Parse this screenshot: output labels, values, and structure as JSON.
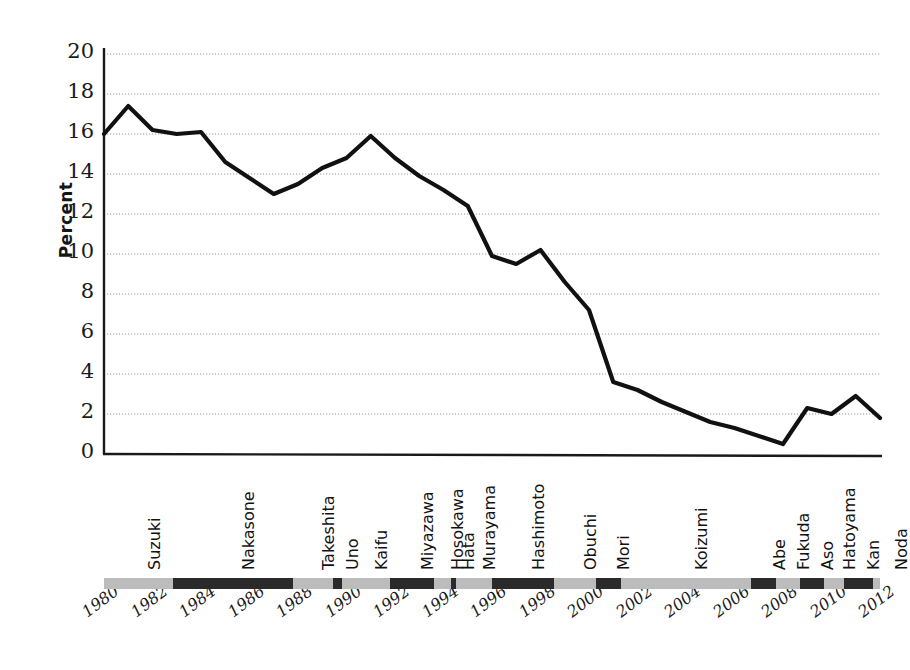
{
  "chart_data": {
    "type": "line",
    "title": "",
    "xlabel": "",
    "ylabel": "Percent",
    "ylim": [
      0,
      20
    ],
    "ytick_step": 2,
    "yticks": [
      20,
      18,
      16,
      14,
      12,
      10,
      8,
      6,
      4,
      2,
      0
    ],
    "xlim": [
      1980,
      2012
    ],
    "xticks": [
      "1980",
      "1982",
      "1984",
      "1986",
      "1988",
      "1990",
      "1992",
      "1994",
      "1996",
      "1998",
      "2000",
      "2002",
      "2004",
      "2006",
      "2008",
      "2010",
      "2012"
    ],
    "grid": "horizontal",
    "legend": "none",
    "series": [
      {
        "name": "Percent",
        "color": "#111111",
        "x": [
          1980,
          1981,
          1982,
          1983,
          1984,
          1985,
          1986,
          1987,
          1988,
          1989,
          1990,
          1991,
          1992,
          1993,
          1994,
          1995,
          1996,
          1997,
          1998,
          1999,
          2000,
          2001,
          2002,
          2003,
          2004,
          2005,
          2006,
          2007,
          2008,
          2009,
          2010,
          2011,
          2012
        ],
        "values": [
          16.0,
          17.4,
          16.2,
          16.0,
          16.1,
          14.6,
          13.8,
          13.0,
          13.5,
          14.3,
          14.8,
          15.9,
          14.8,
          13.9,
          13.2,
          12.4,
          9.9,
          9.5,
          10.2,
          8.6,
          7.2,
          3.6,
          3.2,
          2.6,
          2.1,
          1.6,
          1.3,
          0.9,
          0.5,
          2.3,
          2.0,
          2.9,
          1.8
        ]
      }
    ]
  },
  "pm_terms": [
    {
      "name": "Suzuki",
      "start": 1980.0,
      "end": 1982.85,
      "shade": "light"
    },
    {
      "name": "Nakasone",
      "start": 1982.85,
      "end": 1987.8,
      "shade": "dark"
    },
    {
      "name": "Takeshita",
      "start": 1987.8,
      "end": 1989.45,
      "shade": "light"
    },
    {
      "name": "Uno",
      "start": 1989.45,
      "end": 1989.8,
      "shade": "dark"
    },
    {
      "name": "Kaifu",
      "start": 1989.8,
      "end": 1991.8,
      "shade": "light"
    },
    {
      "name": "Miyazawa",
      "start": 1991.8,
      "end": 1993.6,
      "shade": "dark"
    },
    {
      "name": "Hosokawa",
      "start": 1993.6,
      "end": 1994.3,
      "shade": "light"
    },
    {
      "name": "Hata",
      "start": 1994.3,
      "end": 1994.5,
      "shade": "dark"
    },
    {
      "name": "Murayama",
      "start": 1994.5,
      "end": 1996.0,
      "shade": "light"
    },
    {
      "name": "Hashimoto",
      "start": 1996.0,
      "end": 1998.55,
      "shade": "dark"
    },
    {
      "name": "Obuchi",
      "start": 1998.55,
      "end": 2000.3,
      "shade": "light"
    },
    {
      "name": "Mori",
      "start": 2000.3,
      "end": 2001.3,
      "shade": "dark"
    },
    {
      "name": "Koizumi",
      "start": 2001.3,
      "end": 2006.7,
      "shade": "light"
    },
    {
      "name": "Abe",
      "start": 2006.7,
      "end": 2007.7,
      "shade": "dark"
    },
    {
      "name": "Fukuda",
      "start": 2007.7,
      "end": 2008.7,
      "shade": "light"
    },
    {
      "name": "Aso",
      "start": 2008.7,
      "end": 2009.7,
      "shade": "dark"
    },
    {
      "name": "Hatoyama",
      "start": 2009.7,
      "end": 2010.5,
      "shade": "light"
    },
    {
      "name": "Kan",
      "start": 2010.5,
      "end": 2011.7,
      "shade": "dark"
    },
    {
      "name": "Noda",
      "start": 2011.7,
      "end": 2012.8,
      "shade": "light"
    }
  ],
  "colors": {
    "line": "#111111",
    "axis": "#1a1a1a",
    "grid": "#999999",
    "bar_light": "#bcbcbc",
    "bar_dark": "#2a2a2a",
    "background": "#ffffff"
  }
}
